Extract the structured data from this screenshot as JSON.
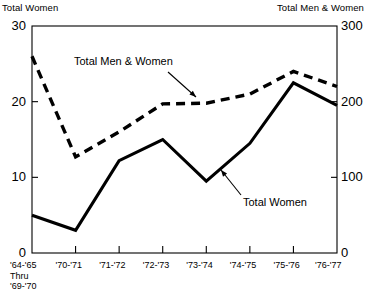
{
  "chart_data": {
    "type": "line",
    "title": "",
    "xlabel": "",
    "ylabel": "Total Women",
    "y2label": "Total Men & Women",
    "grid": false,
    "legend_position": "inline-annotations",
    "categories": [
      "'64-'65\nThru\n'69-'70",
      "'70-'71",
      "'71-'72",
      "'72-'73",
      "'73-'74",
      "'74-'75",
      "'75-'76",
      "'76-'77"
    ],
    "category_lines": [
      [
        "'64-'65",
        "Thru",
        "'69-'70"
      ],
      [
        "'70-'71"
      ],
      [
        "'71-'72"
      ],
      [
        "'72-'73"
      ],
      [
        "'73-'74"
      ],
      [
        "'74-'75"
      ],
      [
        "'75-'76"
      ],
      [
        "'76-'77"
      ]
    ],
    "ylim": [
      0,
      30
    ],
    "yticks": [
      0,
      10,
      20,
      30
    ],
    "ytick_labels": [
      "0",
      "10",
      "20",
      "30"
    ],
    "y2lim": [
      0,
      300
    ],
    "y2ticks": [
      0,
      100,
      200,
      300
    ],
    "y2tick_labels": [
      "0",
      "100",
      "200",
      "300"
    ],
    "series": [
      {
        "name": "Total Women",
        "axis": "left",
        "style": "solid",
        "values": [
          5.0,
          3.0,
          12.2,
          15.0,
          9.5,
          14.5,
          22.5,
          19.5
        ]
      },
      {
        "name": "Total Men & Women",
        "axis": "right",
        "style": "dashed",
        "values": [
          260,
          127,
          160,
          197,
          198,
          210,
          240,
          220
        ],
        "values_left_scale": [
          26.0,
          12.7,
          16.0,
          19.7,
          19.8,
          21.0,
          24.0,
          22.0
        ]
      }
    ],
    "annotations": [
      {
        "text": "Total Men & Women",
        "target_series": "Total Men & Women"
      },
      {
        "text": "Total Women",
        "target_series": "Total Women"
      }
    ]
  },
  "axis_titles": {
    "left": "Total Women",
    "right": "Total Men & Women"
  },
  "annotations": {
    "men_women": "Total Men & Women",
    "women": "Total Women"
  },
  "colors": {
    "line": "#000000",
    "background": "#ffffff",
    "axis": "#000000"
  }
}
